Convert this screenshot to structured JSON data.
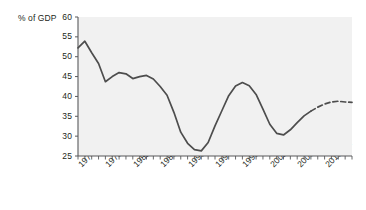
{
  "chart_data": {
    "type": "line",
    "title": "",
    "subtitle": "",
    "xlabel": "",
    "ylabel": "% of GDP",
    "ylim": [
      25,
      60
    ],
    "ytick_labels": [
      "60",
      "55",
      "50",
      "45",
      "40",
      "35",
      "30",
      "25"
    ],
    "ytick_values": [
      60,
      55,
      50,
      45,
      40,
      35,
      30,
      25
    ],
    "grid": false,
    "legend": "none",
    "x": [
      "1974–75",
      "1975–76",
      "1976–77",
      "1977–78",
      "1978–79",
      "1979–80",
      "1980–81",
      "1981–82",
      "1982–83",
      "1983–84",
      "1984–85",
      "1985–86",
      "1986–87",
      "1987–88",
      "1988–89",
      "1989–90",
      "1990–91",
      "1991–92",
      "1992–93",
      "1993–94",
      "1994–95",
      "1995–96",
      "1996–97",
      "1997–98",
      "1998–99",
      "1999–00",
      "2000–01",
      "2001–02",
      "2002–03",
      "2003–04",
      "2004–05",
      "2005–06",
      "2006–07",
      "2007–08",
      "2008–09",
      "2009–10",
      "2010–11",
      "2011–12",
      "2012–13",
      "2013–14",
      "2014–15"
    ],
    "xtick_labels": [
      "1974–75",
      "1978–79",
      "1982–83",
      "1986–87",
      "1990–91",
      "1994–95",
      "1998–99",
      "2002–03",
      "2006–07",
      "2010–11"
    ],
    "xtick_label_indices": [
      0,
      4,
      8,
      12,
      16,
      20,
      24,
      28,
      32,
      36
    ],
    "values": [
      52.2,
      53.9,
      51.0,
      48.3,
      43.7,
      45.0,
      46.0,
      45.7,
      44.5,
      45.0,
      45.3,
      44.4,
      42.5,
      40.3,
      36.0,
      31.0,
      28.2,
      26.6,
      26.3,
      28.4,
      32.6,
      36.4,
      40.2,
      42.6,
      43.5,
      42.7,
      40.5,
      36.8,
      33.0,
      30.7,
      30.3,
      31.6,
      33.4,
      35.1,
      36.3,
      37.3,
      38.1,
      38.6,
      38.8,
      38.6,
      38.5
    ],
    "series": [
      {
        "name": "Actual",
        "style": "solid",
        "color": "#4d4d4d",
        "start_index": 0,
        "end_index": 34
      },
      {
        "name": "Projected",
        "style": "dashed",
        "color": "#4d4d4d",
        "start_index": 34,
        "end_index": 40
      }
    ],
    "colors": {
      "line": "#4d4d4d",
      "plot_background": "#f1f1f1",
      "axis": "#58595b",
      "text": "#231f20"
    }
  }
}
